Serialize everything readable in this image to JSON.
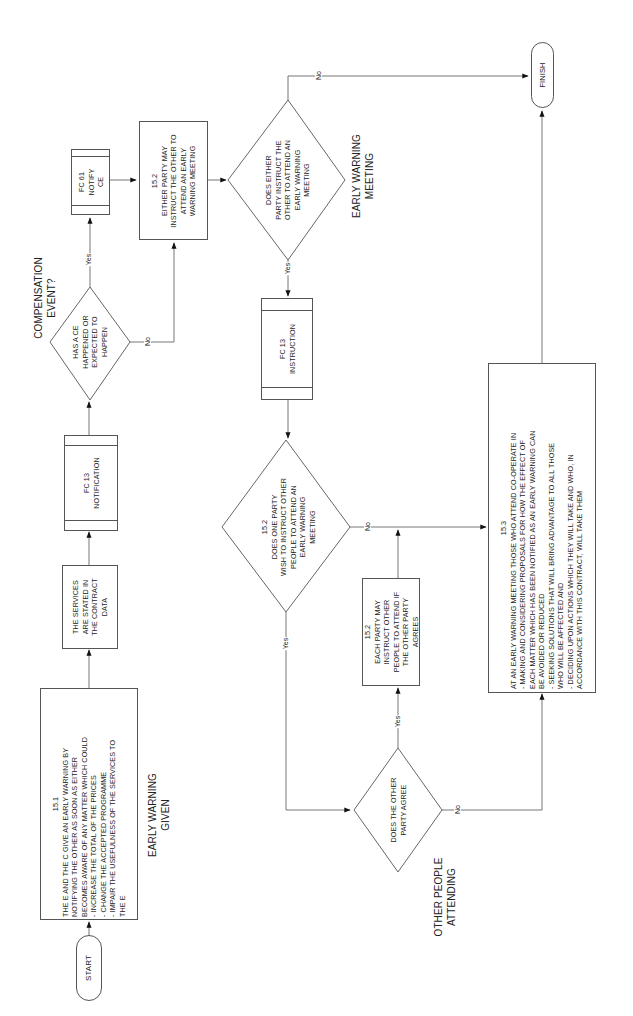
{
  "diagram": {
    "orientation": "rotated-90-ccw",
    "nodes": {
      "start": {
        "label": "START"
      },
      "finish": {
        "label": "FINISH"
      },
      "early_warning": {
        "ref": "15.1",
        "lines": [
          "THE E AND THE C GIVE AN EARLY WARNING BY",
          "NOTIFYING THE OTHER AS SOON AS EITHER",
          "BECOMES AWARE OF ANY MATTER WHICH COULD",
          "-  INCREASE THE TOTAL OF THE PRICES",
          "-  CHANGE THE ACCEPTED PROGRAMME",
          "-  IMPAIR THE USEFULNESS  OF THE SERVICES TO",
          "   THE E"
        ]
      },
      "services": {
        "lines": [
          "THE SERVICES",
          "ARE STATED IN",
          "THE CONTRACT",
          "DATA"
        ]
      },
      "fc13_notification": {
        "lines": [
          "FC 13",
          "NOTIFICATION"
        ]
      },
      "has_ce": {
        "lines": [
          "HAS A CE",
          "HAPPENED OR",
          "EXPECTED TO",
          "HAPPEN"
        ]
      },
      "fc61_notify": {
        "lines": [
          "FC 61",
          "NOTIFY",
          "CE"
        ]
      },
      "either_party_may": {
        "ref": "15.2",
        "lines": [
          "EITHER PARTY MAY",
          "INSTRUCT THE OTHER TO",
          "ATTEND AN EARLY",
          "WARNING MEETING"
        ]
      },
      "does_either_party": {
        "lines": [
          "DOES EITHER",
          "PARTY INSTRUCT THE",
          "OTHER TO ATTEND AN",
          "EARLY WARNING",
          "MEETING"
        ]
      },
      "fc13_instruction": {
        "lines": [
          "FC 13",
          "INSTRUCTION"
        ]
      },
      "does_one_party": {
        "ref": "15.2",
        "lines": [
          "DOES ONE PARTY",
          "WISH TO INSTRUCT OTHER",
          "PEOPLE TO ATTEND AN",
          "EARLY WARNING",
          "MEETING"
        ]
      },
      "each_party_may": {
        "ref": "15.2",
        "lines": [
          "EACH PARTY MAY",
          "INSTRUCT OTHER",
          "PEOPLE TO ATTEND IF",
          "THE OTHER PARTY",
          "AGREES"
        ]
      },
      "does_other_agree": {
        "lines": [
          "DOES THE OTHER",
          "PARTY AGREE"
        ]
      },
      "meeting_actions": {
        "ref": "15.3",
        "lines": [
          "AT AN EARLY WARNING MEETING THOSE WHO ATTEND CO-OPERATE IN",
          "-  MAKING AND CONSIDERING PROPOSALS FOR HOW THE EFFECT OF",
          "   EACH MATTER WHICH HAS BEEN NOTIFIED AS AN EARLY WARNING CAN",
          "   BE AVOIDED OR REDUCED",
          "-  SEEKING SOLUTIONS THAT WILL BRING ADVANTAGE TO ALL THOSE",
          "   WHO WILL BE AFFECTED AND",
          "-  DECIDING UPON ACTIONS WHICH THEY WILL TAKE AND WHO, IN",
          "   ACCORDANCE WITH THIS CONTRACT, WILL TAKE THEM"
        ]
      }
    },
    "section_labels": {
      "early_warning_given": [
        "EARLY WARNING",
        "GIVEN"
      ],
      "compensation_event": [
        "COMPENSATION",
        "EVENT?"
      ],
      "early_warning_meeting": [
        "EARLY WARNING",
        "MEETING"
      ],
      "other_people_attending": [
        "OTHER PEOPLE",
        "ATTENDING"
      ]
    },
    "edge_labels": {
      "yes": "Yes",
      "no": "No"
    }
  }
}
